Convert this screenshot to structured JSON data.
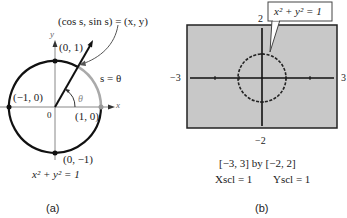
{
  "panel_a": {
    "caption": "(a)",
    "point_label": "(cos s, sin s) = (x, y)",
    "arc_label": "s = θ",
    "angle_label": "θ",
    "origin_label": "0",
    "x_axis_label": "x",
    "y_axis_label": "y",
    "points": [
      {
        "label": "(0, 1)"
      },
      {
        "label": "(−1, 0)"
      },
      {
        "label": "(1, 0)"
      },
      {
        "label": "(0, −1)"
      }
    ],
    "equation": "x² + y² = 1"
  },
  "panel_b": {
    "caption": "(b)",
    "callout": "x² + y² = 1",
    "ymax_label": "2",
    "ymin_label": "−2",
    "xmin_label": "−3",
    "xmax_label": "3",
    "window": "[−3, 3]  by  [−2, 2]",
    "xscl": "Xscl = 1",
    "yscl": "Yscl = 1",
    "screen_color": "#c8c8c8"
  }
}
